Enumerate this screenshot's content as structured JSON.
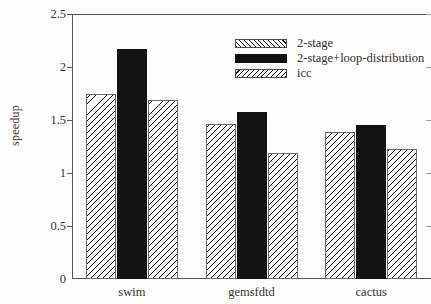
{
  "chart_data": {
    "type": "bar",
    "title": "",
    "xlabel": "",
    "ylabel": "speedup",
    "categories": [
      "swim",
      "gemsfdtd",
      "cactus"
    ],
    "series": [
      {
        "name": "2-stage",
        "values": [
          1.75,
          1.46,
          1.39
        ],
        "pattern": "hatch-backslash"
      },
      {
        "name": "2-stage+loop-distribution",
        "values": [
          2.17,
          1.58,
          1.45
        ],
        "pattern": "solid-black"
      },
      {
        "name": "icc",
        "values": [
          1.69,
          1.19,
          1.23
        ],
        "pattern": "hatch-forwardslash"
      }
    ],
    "ylim": [
      0,
      2.5
    ],
    "yticks": [
      0,
      0.5,
      1,
      1.5,
      2,
      2.5
    ],
    "ytick_labels": [
      "0",
      "0.5",
      "1",
      "1.5",
      "2",
      "2.5"
    ],
    "grid": false,
    "legend_position": "top-center",
    "colors": {
      "solid": "#121212",
      "hatch_line": "#000000",
      "hatch_background": "#ffffff",
      "axis": "#555555"
    }
  }
}
